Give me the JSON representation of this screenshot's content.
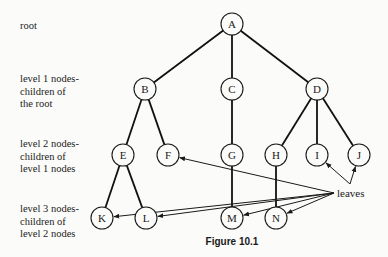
{
  "level_labels": [
    {
      "id": "root",
      "lines": [
        "root"
      ],
      "x": 20,
      "y": 20
    },
    {
      "id": "level1",
      "lines": [
        "level 1 nodes-",
        "children of",
        "the root"
      ],
      "x": 20,
      "y": 73
    },
    {
      "id": "level2",
      "lines": [
        "level 2 nodes-",
        "children of",
        "level 1 nodes"
      ],
      "x": 20,
      "y": 138
    },
    {
      "id": "level3",
      "lines": [
        "level 3 nodes-",
        "children of",
        "level 2 nodes"
      ],
      "x": 20,
      "y": 203
    }
  ],
  "nodes": [
    {
      "id": "A",
      "label": "A",
      "x": 232,
      "y": 24
    },
    {
      "id": "B",
      "label": "B",
      "x": 145,
      "y": 89
    },
    {
      "id": "C",
      "label": "C",
      "x": 232,
      "y": 89
    },
    {
      "id": "D",
      "label": "D",
      "x": 317,
      "y": 89
    },
    {
      "id": "E",
      "label": "E",
      "x": 123,
      "y": 155
    },
    {
      "id": "F",
      "label": "F",
      "x": 168,
      "y": 155
    },
    {
      "id": "G",
      "label": "G",
      "x": 232,
      "y": 155
    },
    {
      "id": "H",
      "label": "H",
      "x": 276,
      "y": 155
    },
    {
      "id": "I",
      "label": "I",
      "x": 317,
      "y": 155
    },
    {
      "id": "J",
      "label": "J",
      "x": 359,
      "y": 155
    },
    {
      "id": "K",
      "label": "K",
      "x": 102,
      "y": 218
    },
    {
      "id": "L",
      "label": "L",
      "x": 146,
      "y": 218
    },
    {
      "id": "M",
      "label": "M",
      "x": 232,
      "y": 218
    },
    {
      "id": "N",
      "label": "N",
      "x": 276,
      "y": 218
    }
  ],
  "edges": [
    [
      "A",
      "B"
    ],
    [
      "A",
      "C"
    ],
    [
      "A",
      "D"
    ],
    [
      "B",
      "E"
    ],
    [
      "B",
      "F"
    ],
    [
      "C",
      "G"
    ],
    [
      "D",
      "H"
    ],
    [
      "D",
      "I"
    ],
    [
      "D",
      "J"
    ],
    [
      "E",
      "K"
    ],
    [
      "E",
      "L"
    ],
    [
      "G",
      "M"
    ],
    [
      "H",
      "N"
    ]
  ],
  "annotation": {
    "text": "leaves",
    "text_x": 337,
    "text_y": 197,
    "origin": {
      "x": 334,
      "y": 193
    },
    "ij_origin": {
      "x": 350,
      "y": 184
    },
    "leaf_targets": [
      "F",
      "I",
      "J",
      "K",
      "L",
      "M",
      "N"
    ]
  },
  "caption": "Figure  10.1",
  "node_radius": 11
}
